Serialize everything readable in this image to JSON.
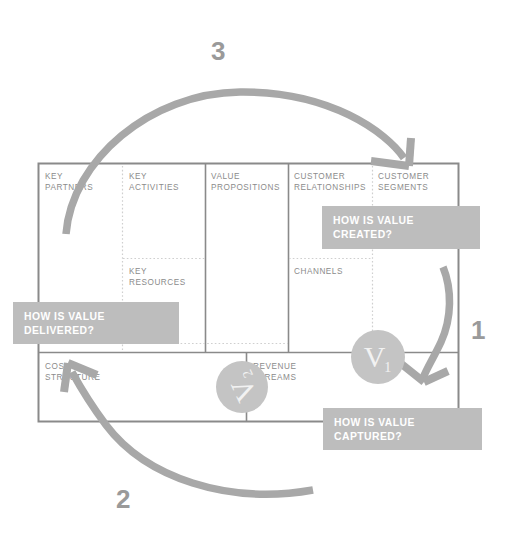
{
  "diagram": {
    "type": "business-model-canvas",
    "colors": {
      "canvas_border": "#8a8a8a",
      "grid_dotted": "#cfcfcf",
      "block_title_text": "#8b8b8b",
      "label_box_fill": "#bdbdbd",
      "label_box_text": "#ffffff",
      "arrow": "#a8a8a8",
      "badge_fill": "#c4c4c4",
      "badge_text": "#f2f2f2",
      "step_number": "#9a9a9a",
      "background": "#ffffff"
    }
  },
  "canvas": {
    "blocks": [
      {
        "id": "key-partners",
        "label": "KEY\nPARTNERS"
      },
      {
        "id": "key-activities",
        "label": "KEY\nACTIVITIES"
      },
      {
        "id": "key-resources",
        "label": "KEY\nRESOURCES"
      },
      {
        "id": "value-propositions",
        "label": "VALUE\nPROPOSITIONS"
      },
      {
        "id": "customer-relationships",
        "label": "CUSTOMER\nRELATIONSHIPS"
      },
      {
        "id": "channels",
        "label": "CHANNELS"
      },
      {
        "id": "customer-segments",
        "label": "CUSTOMER\nSEGMENTS"
      },
      {
        "id": "cost-structure",
        "label": "COST\nSTRUCTURE"
      },
      {
        "id": "revenue-streams",
        "label": "REVENUE\nSTREAMS"
      }
    ]
  },
  "labels": {
    "created": "HOW IS VALUE\nCREATED?",
    "delivered": "HOW IS VALUE\nDELIVERED?",
    "captured": "HOW IS VALUE\nCAPTURED?"
  },
  "badges": {
    "v1": {
      "letter": "V",
      "subscript": "1"
    },
    "v2": {
      "letter": "V",
      "subscript": "2"
    }
  },
  "steps": {
    "one": "1",
    "two": "2",
    "three": "3"
  },
  "arrows": [
    {
      "id": "arrow-step-1",
      "from": "customer-segments",
      "to": "revenue-streams-right",
      "step": "1"
    },
    {
      "id": "arrow-step-2",
      "from": "bottom-right",
      "to": "cost-structure",
      "step": "2"
    },
    {
      "id": "arrow-step-3",
      "from": "key-partners",
      "to": "customer-segments",
      "step": "3"
    }
  ]
}
